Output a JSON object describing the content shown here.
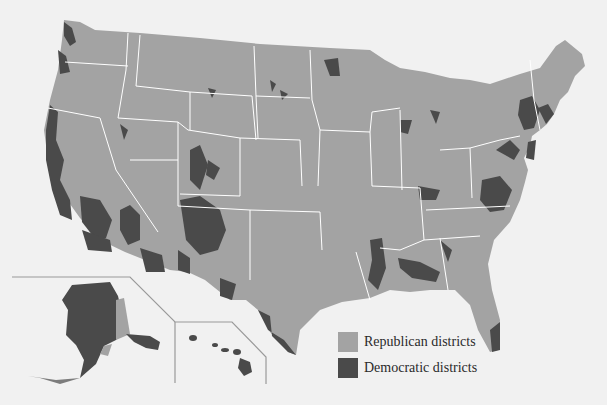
{
  "map": {
    "title": "",
    "region": "United States",
    "insets": [
      "Alaska",
      "Hawaii"
    ],
    "colors": {
      "background": "#f1f1f1",
      "republican": "#a3a3a3",
      "democratic": "#4a4a4a",
      "state_border": "#ffffff",
      "inset_border": "#9a9a9a"
    }
  },
  "legend": {
    "items": [
      {
        "label": "Republican districts",
        "color": "#a3a3a3"
      },
      {
        "label": "Democratic districts",
        "color": "#4a4a4a"
      }
    ]
  }
}
